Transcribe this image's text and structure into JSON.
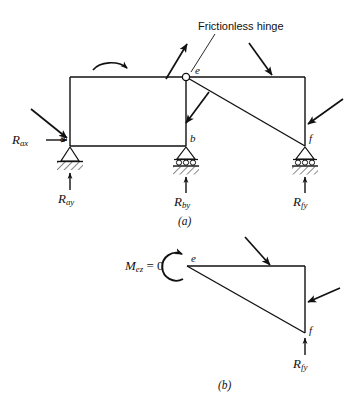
{
  "figure": {
    "title_annotation": "Frictionless hinge",
    "stroke_color": "#111111",
    "background_color": "#ffffff"
  },
  "diagram_a": {
    "caption": "(a)",
    "points": {
      "a": "a",
      "b": "b",
      "e": "e",
      "f": "f"
    },
    "reactions": {
      "rax_symbol": "R",
      "rax_subscript": "ax",
      "ray_symbol": "R",
      "ray_subscript": "ay",
      "rby_symbol": "R",
      "rby_subscript": "by",
      "rfy_symbol": "R",
      "rfy_subscript": "fy"
    },
    "supports": [
      {
        "name": "pin-support-a",
        "type": "pin",
        "label": "a"
      },
      {
        "name": "roller-support-b",
        "type": "roller",
        "label": "b"
      },
      {
        "name": "roller-support-f",
        "type": "roller",
        "label": "f"
      }
    ],
    "applied_loads": [
      {
        "name": "load-arrow-left-edge",
        "direction": "down-right"
      },
      {
        "name": "load-arrow-hinge-up",
        "direction": "up-right"
      },
      {
        "name": "load-arrow-top-right",
        "direction": "down-right"
      },
      {
        "name": "load-arrow-right-edge",
        "direction": "down-left"
      },
      {
        "name": "load-arrow-vertical-member",
        "direction": "down-left"
      },
      {
        "name": "applied-moment-couple",
        "direction": "counterclockwise"
      }
    ]
  },
  "diagram_b": {
    "caption": "(b)",
    "points": {
      "e": "e",
      "f": "f"
    },
    "moment_label": {
      "symbol": "M",
      "subscript": "ez",
      "equals_value": "= 0"
    },
    "reactions": {
      "rfy_symbol": "R",
      "rfy_subscript": "fy"
    },
    "applied_loads": [
      {
        "name": "load-arrow-b-top",
        "direction": "down-right"
      },
      {
        "name": "load-arrow-b-right",
        "direction": "down-left"
      }
    ]
  }
}
